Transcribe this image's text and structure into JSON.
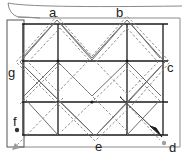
{
  "diagram": {
    "labels": [
      {
        "id": "a",
        "text": "a"
      },
      {
        "id": "b",
        "text": "b"
      },
      {
        "id": "c",
        "text": "c"
      },
      {
        "id": "d",
        "text": "d"
      },
      {
        "id": "e",
        "text": "e"
      },
      {
        "id": "f",
        "text": "f"
      },
      {
        "id": "g",
        "text": "g"
      }
    ],
    "colors": {
      "grid": "#1a1a1a",
      "paper_edge": "#8a8a8a",
      "crease_solid": "#6e6e6e",
      "crease_dashed": "#8c8c8c",
      "arrow_gray": "#9a9a9a",
      "point": "#333333",
      "point_gray": "#a0a0a0"
    }
  }
}
